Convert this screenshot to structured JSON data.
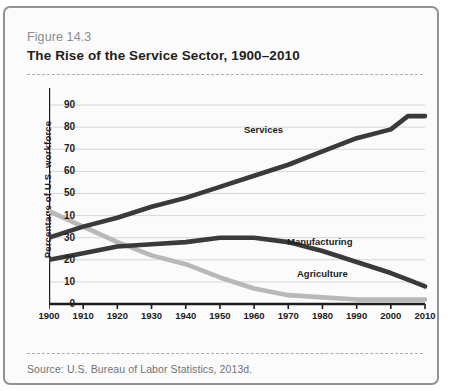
{
  "figure": {
    "number": "Figure 14.3",
    "title": "The Rise of the Service Sector, 1900–2010",
    "source": "Source: U.S. Bureau of Labor Statistics, 2013d."
  },
  "colors": {
    "frame": "#8e9396",
    "dark_series": "#3a3a3a",
    "light_series": "#b8b8b8",
    "gridline": "#d6d6d6",
    "axis": "#1d1d1d",
    "figure_number": "#8a8d90",
    "source_text": "#6f7376"
  },
  "chart_data": {
    "type": "line",
    "title": "The Rise of the Service Sector, 1900–2010",
    "xlabel": "",
    "ylabel": "Percentage of U.S. workforce",
    "xlim": [
      1900,
      2010
    ],
    "ylim": [
      0,
      95
    ],
    "grid": true,
    "legend": "inline-labels",
    "x_ticks": [
      1900,
      1910,
      1920,
      1930,
      1940,
      1950,
      1960,
      1970,
      1980,
      1990,
      2000,
      2010
    ],
    "y_ticks": [
      0,
      10,
      20,
      30,
      40,
      50,
      60,
      70,
      80,
      90
    ],
    "y_tick_labels": [
      "0",
      "10",
      "20",
      "30",
      "10",
      "50",
      "60",
      "70",
      "80",
      "90"
    ],
    "x": [
      1900,
      1910,
      1920,
      1930,
      1940,
      1950,
      1960,
      1970,
      1980,
      1990,
      2000,
      2005,
      2010
    ],
    "series": [
      {
        "name": "Services",
        "color": "#3a3a3a",
        "values": [
          30,
          35,
          39,
          44,
          48,
          53,
          58,
          63,
          69,
          75,
          79,
          85,
          85
        ]
      },
      {
        "name": "Manufacturing",
        "color": "#3a3a3a",
        "values": [
          20,
          23,
          26,
          27,
          28,
          30,
          30,
          28,
          24,
          19,
          14,
          11,
          8
        ]
      },
      {
        "name": "Agriculture",
        "color": "#b8b8b8",
        "values": [
          42,
          35,
          28,
          22,
          18,
          12,
          7,
          4,
          3,
          2,
          2,
          2,
          2
        ]
      }
    ]
  }
}
